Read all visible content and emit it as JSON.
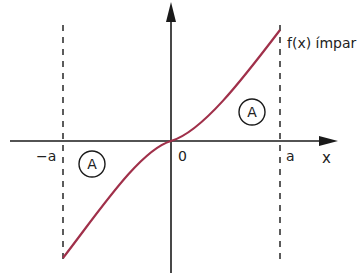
{
  "diagram": {
    "function_label": "f(x) ímpar",
    "origin_label": "0",
    "neg_a_label": "−a",
    "pos_a_label": "a",
    "x_axis_label": "x",
    "region_left_label": "A",
    "region_right_label": "A",
    "colors": {
      "axis": "#1a1a1a",
      "curve": "#a0304a",
      "dashed": "#333333",
      "text": "#222222"
    }
  }
}
